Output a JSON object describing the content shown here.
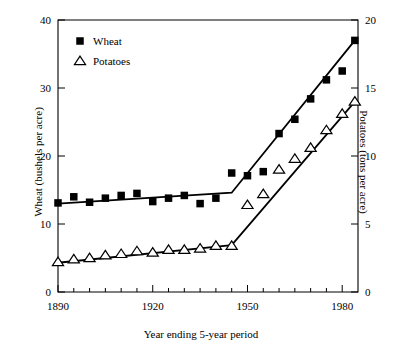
{
  "chart_data": {
    "type": "scatter",
    "title": "",
    "xlabel": "Year ending 5-year period",
    "ylabel": "Wheat (bushels per acre)",
    "ylabel_right": "Potatoes (tons per acre)",
    "xlim": [
      1890,
      1985
    ],
    "ylim": [
      0,
      40
    ],
    "ylim_right": [
      0,
      20
    ],
    "grid": false,
    "legend_position": "top-left",
    "x_ticks_major": [
      1890,
      1920,
      1950,
      1980
    ],
    "x_ticks_minor_step": 5,
    "y_ticks_left": [
      0,
      10,
      20,
      30,
      40
    ],
    "y_ticks_right": [
      0,
      5,
      10,
      15,
      20
    ],
    "legend": [
      {
        "label": "Wheat",
        "marker": "filled-square",
        "color": "#000000"
      },
      {
        "label": "Potatoes",
        "marker": "open-triangle",
        "color": "#000000"
      }
    ],
    "series": [
      {
        "name": "Wheat",
        "unit": "bushels per acre",
        "axis": "left",
        "marker": "filled-square",
        "x": [
          1890,
          1895,
          1900,
          1905,
          1910,
          1915,
          1920,
          1925,
          1930,
          1935,
          1940,
          1945,
          1950,
          1955,
          1960,
          1965,
          1970,
          1975,
          1980,
          1984
        ],
        "values": [
          13.1,
          14.0,
          13.2,
          13.8,
          14.2,
          14.5,
          13.3,
          13.8,
          14.2,
          13.0,
          13.8,
          17.5,
          17.1,
          17.7,
          23.3,
          25.4,
          28.4,
          31.2,
          32.5,
          37.0
        ]
      },
      {
        "name": "Potatoes",
        "unit": "tons per acre",
        "axis": "right",
        "marker": "open-triangle",
        "x": [
          1890,
          1895,
          1900,
          1905,
          1910,
          1915,
          1920,
          1925,
          1930,
          1935,
          1940,
          1945,
          1950,
          1955,
          1960,
          1965,
          1970,
          1975,
          1980,
          1984
        ],
        "values": [
          2.2,
          2.4,
          2.5,
          2.7,
          2.8,
          3.0,
          2.9,
          3.1,
          3.1,
          3.2,
          3.4,
          3.4,
          6.4,
          7.2,
          9.0,
          9.8,
          10.6,
          11.9,
          13.1,
          14.0
        ]
      }
    ],
    "fit_lines": [
      {
        "name": "Wheat fitted segments",
        "axis": "left",
        "breakpoints": [
          {
            "x": 1890,
            "y": 13.0
          },
          {
            "x": 1945,
            "y": 14.6
          },
          {
            "x": 1984,
            "y": 37.0
          }
        ]
      },
      {
        "name": "Potatoes fitted segments",
        "axis": "right",
        "breakpoints": [
          {
            "x": 1890,
            "y": 2.15
          },
          {
            "x": 1945,
            "y": 3.45
          },
          {
            "x": 1984,
            "y": 14.0
          }
        ]
      }
    ]
  }
}
